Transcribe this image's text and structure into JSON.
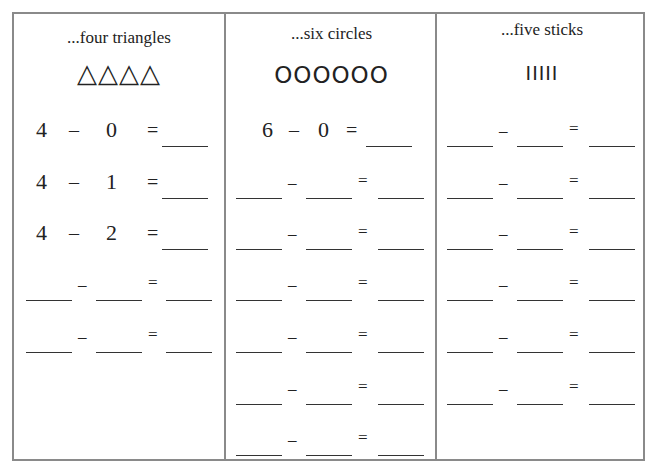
{
  "columns": [
    {
      "heading": "...four triangles",
      "shapes": "△△△△",
      "shape_icon": "triangle-icon",
      "filled_rows": [
        {
          "a": "4",
          "minus": "–",
          "b": "0",
          "eq": "="
        },
        {
          "a": "4",
          "minus": "–",
          "b": "1",
          "eq": "="
        },
        {
          "a": "4",
          "minus": "–",
          "b": "2",
          "eq": "="
        }
      ],
      "blank_rows": 2
    },
    {
      "heading": "...six circles",
      "shapes": "OOOOOO",
      "shape_icon": "circle-icon",
      "filled_rows": [
        {
          "a": "6",
          "minus": "–",
          "b": "0",
          "eq": "="
        }
      ],
      "blank_rows": 6
    },
    {
      "heading": "...five sticks",
      "shapes": "IIIII",
      "shape_icon": "stick-icon",
      "filled_rows": [],
      "blank_rows": 6
    }
  ],
  "symbols": {
    "minus": "–",
    "equals": "="
  }
}
